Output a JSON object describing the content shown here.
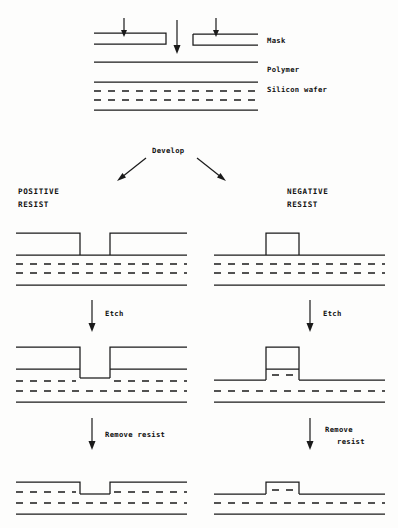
{
  "figure": {
    "ink_color": "#1a1a1a",
    "background_color": "#fdfdfc"
  },
  "top_stage": {
    "labels": {
      "mask": "Mask",
      "polymer": "Polymer",
      "wafer": "Silicon wafer"
    },
    "exposure_arrows": 3
  },
  "develop": {
    "label": "Develop"
  },
  "columns": {
    "positive": {
      "heading_line1": "POSITIVE",
      "heading_line2": "RESIST",
      "etch_label": "Etch",
      "remove_label_line1": "Remove resist",
      "remove_label_line2": ""
    },
    "negative": {
      "heading_line1": "NEGATIVE",
      "heading_line2": "RESIST",
      "etch_label": "Etch",
      "remove_label_line1": "Remove",
      "remove_label_line2": "resist"
    }
  }
}
